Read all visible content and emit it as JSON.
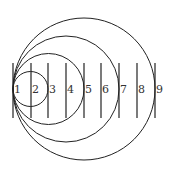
{
  "diagram": {
    "tangent_point": {
      "x": 13,
      "y": 89
    },
    "circles": [
      {
        "id": "c1",
        "cx": 30.5,
        "cy": 89,
        "r": 17.5
      },
      {
        "id": "c2",
        "cx": 48.5,
        "cy": 89,
        "r": 35.5
      },
      {
        "id": "c3",
        "cx": 66,
        "cy": 89,
        "r": 53
      },
      {
        "id": "c4",
        "cx": 84,
        "cy": 89,
        "r": 71
      }
    ],
    "lines": [
      {
        "label": "1",
        "x": 13
      },
      {
        "label": "2",
        "x": 31
      },
      {
        "label": "3",
        "x": 48
      },
      {
        "label": "4",
        "x": 66
      },
      {
        "label": "5",
        "x": 84
      },
      {
        "label": "6",
        "x": 101
      },
      {
        "label": "7",
        "x": 119
      },
      {
        "label": "8",
        "x": 137
      },
      {
        "label": "9",
        "x": 155
      }
    ],
    "line_y1": 63,
    "line_y2": 118,
    "stroke_color": "#222222"
  }
}
